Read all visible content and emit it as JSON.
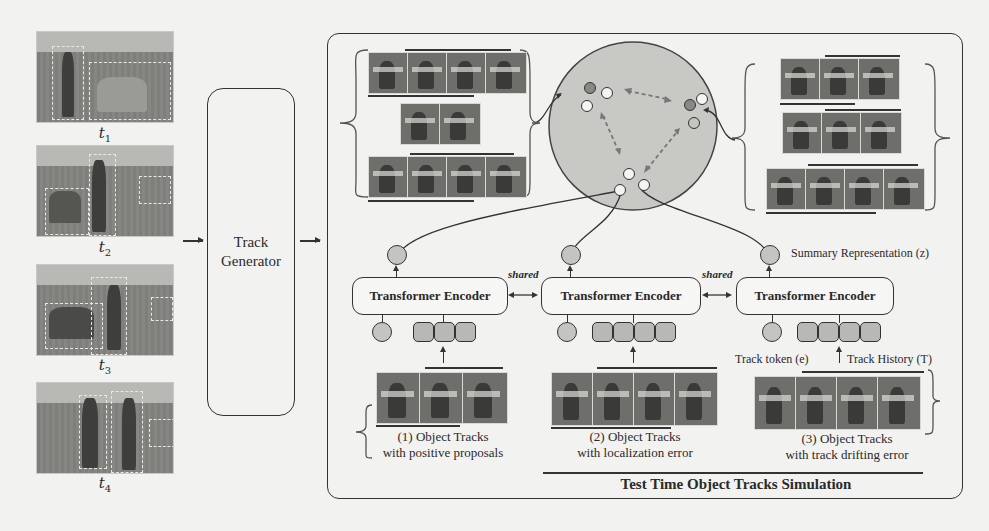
{
  "frames": [
    {
      "label": "t",
      "sub": "1"
    },
    {
      "label": "t",
      "sub": "2"
    },
    {
      "label": "t",
      "sub": "3"
    },
    {
      "label": "t",
      "sub": "4"
    }
  ],
  "generator": {
    "line1": "Track",
    "line2": "Generator"
  },
  "encoders": [
    {
      "label": "Transformer Encoder"
    },
    {
      "label": "Transformer Encoder"
    },
    {
      "label": "Transformer Encoder"
    }
  ],
  "shared_label": "shared",
  "annotations": {
    "summary": "Summary Representation (z)",
    "track_token": "Track token (e)",
    "track_history": "Track History (T)"
  },
  "tracks": [
    {
      "line1": "(1)  Object Tracks",
      "line2": "with positive proposals",
      "history_len": 3
    },
    {
      "line1": "(2) Object Tracks",
      "line2": "with localization error",
      "history_len": 4
    },
    {
      "line1": "(3) Object Tracks",
      "line2": "with track drifting error",
      "history_len": 4
    }
  ],
  "panel_title": "Test Time Object Tracks Simulation",
  "colors": {
    "stroke": "#333333",
    "latent_fill": "#c4c4c0",
    "token_fill": "#b8b8b4",
    "background": "#f2f2f0"
  }
}
